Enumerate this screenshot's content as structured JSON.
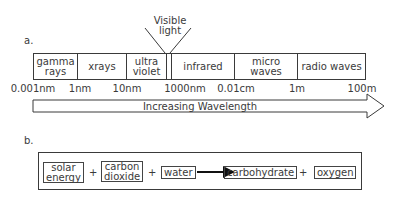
{
  "part_a": {
    "label": "a.",
    "visible_callout": {
      "line1": "Visible",
      "line2": "light"
    },
    "bands": [
      {
        "name": "gamma-rays",
        "line1": "gamma",
        "line2": "rays"
      },
      {
        "name": "xrays",
        "line1": "xrays",
        "line2": ""
      },
      {
        "name": "ultra-violet",
        "line1": "ultra",
        "line2": "violet"
      },
      {
        "name": "visible",
        "line1": "",
        "line2": ""
      },
      {
        "name": "infrared",
        "line1": "infrared",
        "line2": ""
      },
      {
        "name": "micro-waves",
        "line1": "micro",
        "line2": "waves"
      },
      {
        "name": "radio-waves",
        "line1": "radio waves",
        "line2": ""
      }
    ],
    "ticks": [
      "0.001nm",
      "1nm",
      "10nm",
      "1000nm",
      "0.01cm",
      "1m",
      "100m"
    ],
    "arrow_label": "Increasing Wavelength"
  },
  "part_b": {
    "label": "b.",
    "terms": [
      {
        "line1": "solar",
        "line2": "energy"
      },
      {
        "line1": "carbon",
        "line2": "dioxide"
      },
      {
        "line1": "water",
        "line2": ""
      },
      {
        "line1": "carbohydrate",
        "line2": ""
      },
      {
        "line1": "oxygen",
        "line2": ""
      }
    ],
    "plus": "+"
  }
}
